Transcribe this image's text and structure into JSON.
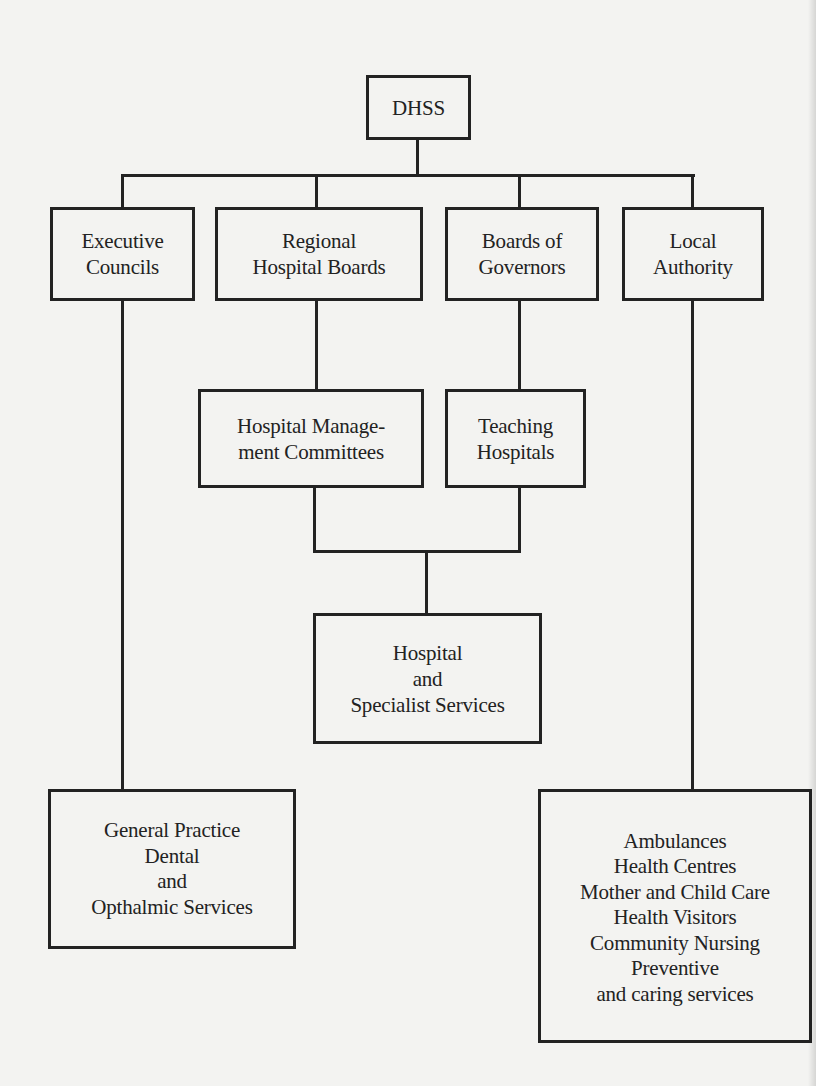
{
  "diagram": {
    "type": "organisation-chart",
    "root": {
      "id": "dhss",
      "lines": [
        "DHSS"
      ]
    },
    "level1": [
      {
        "id": "executive-councils",
        "lines": [
          "Executive",
          "Councils"
        ]
      },
      {
        "id": "regional-hospital-boards",
        "lines": [
          "Regional",
          "Hospital Boards"
        ]
      },
      {
        "id": "boards-of-governors",
        "lines": [
          "Boards of",
          "Governors"
        ]
      },
      {
        "id": "local-authority",
        "lines": [
          "Local",
          "Authority"
        ]
      }
    ],
    "level2": [
      {
        "id": "hospital-management-committees",
        "lines": [
          "Hospital Manage-",
          "ment Committees"
        ],
        "parent": "regional-hospital-boards"
      },
      {
        "id": "teaching-hospitals",
        "lines": [
          "Teaching",
          "Hospitals"
        ],
        "parent": "boards-of-governors"
      }
    ],
    "level3": [
      {
        "id": "hospital-specialist-services",
        "lines": [
          "Hospital",
          "and",
          "Specialist Services"
        ],
        "parents": [
          "hospital-management-committees",
          "teaching-hospitals"
        ]
      }
    ],
    "leaves": [
      {
        "id": "general-practice-services",
        "lines": [
          "General Practice",
          "Dental",
          "and",
          "Opthalmic Services"
        ],
        "parent": "executive-councils"
      },
      {
        "id": "local-authority-services",
        "lines": [
          "Ambulances",
          "Health Centres",
          "Mother and Child Care",
          "Health Visitors",
          "Community Nursing",
          "Preventive",
          "and caring services"
        ],
        "parent": "local-authority"
      }
    ],
    "colors": {
      "paper": "#f3f3f1",
      "ink": "#222222"
    }
  }
}
